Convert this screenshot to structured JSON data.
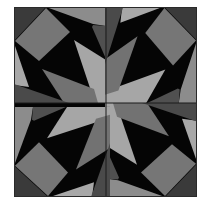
{
  "image": {
    "description": "Geometric pinwheel quilt block in grayscale",
    "width": 208,
    "height": 209
  },
  "quilt": {
    "frame": {
      "x": 14,
      "y": 7,
      "width": 183,
      "height": 190,
      "border_color": "#2a2a2a"
    },
    "center": {
      "x": 106,
      "y": 103
    },
    "quadrants": [
      "top-left",
      "top-right",
      "bottom-right",
      "bottom-left"
    ],
    "symmetry": "4-fold rotational (pinwheel)",
    "colors": {
      "black": "#050505",
      "dark_gray": "#3a3a3a",
      "charcoal": "#4c4c4c",
      "medium_gray": "#767676",
      "light_gray": "#a8a8a8",
      "band_gray": "#8a8a8a",
      "seam": "#1a1a1a"
    }
  }
}
